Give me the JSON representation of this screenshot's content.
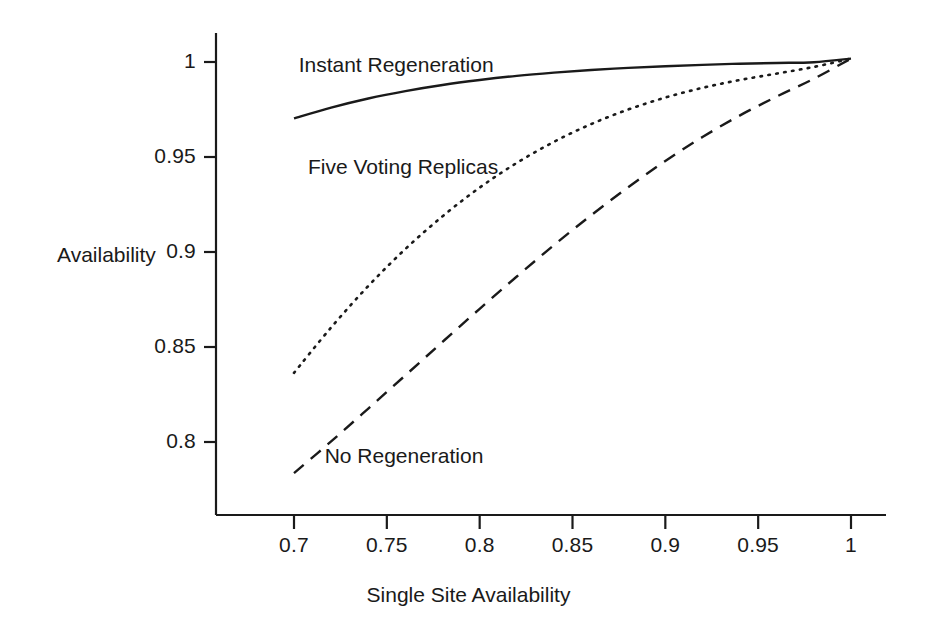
{
  "chart_data": {
    "type": "line",
    "title": "",
    "xlabel": "Single Site Availability",
    "ylabel": "Availability",
    "xlim": [
      0.675,
      1.012
    ],
    "ylim": [
      0.7755,
      1.0075
    ],
    "xticks": [
      "0.7",
      "0.75",
      "0.8",
      "0.85",
      "0.9",
      "0.95",
      "1"
    ],
    "xtick_values": [
      0.7,
      0.75,
      0.8,
      0.85,
      0.9,
      0.95,
      1.0
    ],
    "yticks": [
      "1",
      "0.95",
      "0.9",
      "0.85",
      "0.8"
    ],
    "ytick_values": [
      1.0,
      0.95,
      0.9,
      0.85,
      0.8
    ],
    "grid": false,
    "legend_position": "inline-annotations",
    "x": [
      0.7,
      0.72,
      0.74,
      0.76,
      0.78,
      0.8,
      0.82,
      0.84,
      0.86,
      0.88,
      0.9,
      0.92,
      0.94,
      0.96,
      0.98,
      1.0
    ],
    "series": [
      {
        "name": "Instant Regeneration",
        "style": "solid",
        "values": [
          0.9703,
          0.976,
          0.9808,
          0.9847,
          0.9879,
          0.9905,
          0.9927,
          0.9944,
          0.9958,
          0.9969,
          0.9978,
          0.9985,
          0.9991,
          0.9995,
          0.9999,
          1.0018
        ]
      },
      {
        "name": "Five Voting Replicas",
        "style": "dotted",
        "values": [
          0.8364,
          0.8603,
          0.8821,
          0.9016,
          0.9188,
          0.9339,
          0.9469,
          0.958,
          0.9673,
          0.975,
          0.9813,
          0.9864,
          0.9905,
          0.9939,
          0.9974,
          1.0018
        ]
      },
      {
        "name": "No Regeneration",
        "style": "dashed",
        "values": [
          0.7836,
          0.8003,
          0.8176,
          0.8351,
          0.8527,
          0.8701,
          0.8871,
          0.9036,
          0.9193,
          0.9341,
          0.9479,
          0.9605,
          0.9718,
          0.9818,
          0.9912,
          1.0018
        ]
      }
    ],
    "annotations": [
      {
        "text": "Instant Regeneration",
        "x": 0.7025,
        "y": 0.9975
      },
      {
        "text": "Five Voting Replicas",
        "x": 0.7075,
        "y": 0.9435
      },
      {
        "text": "No Regeneration",
        "x": 0.7165,
        "y": 0.7915
      }
    ]
  }
}
